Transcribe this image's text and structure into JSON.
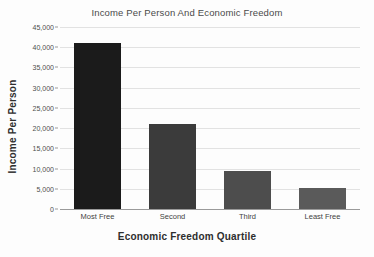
{
  "chart_data": {
    "type": "bar",
    "title": "Income Per Person And Economic Freedom",
    "xlabel": "Economic Freedom Quartile",
    "ylabel": "Income Per Person",
    "categories": [
      "Most Free",
      "Second",
      "Third",
      "Least Free"
    ],
    "values": [
      41000,
      21000,
      9300,
      5200
    ],
    "ylim": [
      0,
      45000
    ],
    "ytick_labels": [
      "45,000",
      "40,000",
      "35,000",
      "30,000",
      "25,000",
      "20,000",
      "15,000",
      "10,000",
      "5,000",
      "0"
    ],
    "ytick_values": [
      45000,
      40000,
      35000,
      30000,
      25000,
      20000,
      15000,
      10000,
      5000,
      0
    ],
    "grid": true,
    "legend": "none",
    "bar_colors": [
      "#1b1b1b",
      "#3b3b3b",
      "#4d4d4d",
      "#5a5a5a"
    ]
  }
}
